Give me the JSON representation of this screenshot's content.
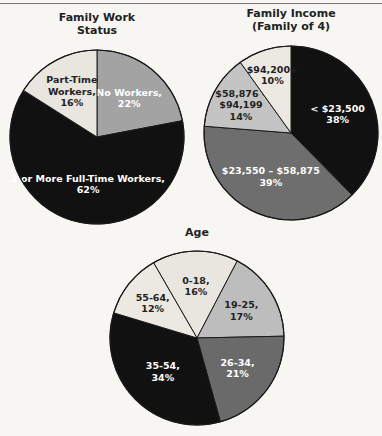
{
  "chart_data": [
    {
      "type": "pie",
      "title": [
        "Family Work",
        "Status"
      ],
      "slices": [
        {
          "label": [
            "No Workers,",
            "22%"
          ],
          "name": "No Workers",
          "value": 22,
          "color": "#a3a3a3",
          "text_color": "#ffffff"
        },
        {
          "label": [
            "1 or More Full-Time Workers,",
            "62%"
          ],
          "name": "1 or More Full-Time Workers",
          "value": 62,
          "color": "#111111",
          "text_color": "#ffffff"
        },
        {
          "label": [
            "Part-Time",
            "Workers,",
            "16%"
          ],
          "name": "Part-Time Workers",
          "value": 16,
          "color": "#e8e6df",
          "text_color": "#222222"
        }
      ],
      "start_angle_deg": 0
    },
    {
      "type": "pie",
      "title": [
        "Family Income",
        "(Family of 4)"
      ],
      "slices": [
        {
          "label": [
            "< $23,500",
            "38%"
          ],
          "name": "< $23,500",
          "value": 38,
          "color": "#111111",
          "text_color": "#ffffff"
        },
        {
          "label": [
            "$23,550 – $58,875",
            "39%"
          ],
          "name": "$23,550 – $58,875",
          "value": 39,
          "color": "#6e6e6e",
          "text_color": "#ffffff"
        },
        {
          "label": [
            "$58,876 –",
            "$94,199",
            "14%"
          ],
          "name": "$58,876 – $94,199",
          "value": 14,
          "color": "#c4c4c4",
          "text_color": "#222222"
        },
        {
          "label": [
            "$94,200+",
            "10%"
          ],
          "name": "$94,200+",
          "value": 10,
          "color": "#ebe9e2",
          "text_color": "#222222"
        }
      ],
      "start_angle_deg": 0
    },
    {
      "type": "pie",
      "title": [
        "Age"
      ],
      "slices": [
        {
          "label": [
            "0-18,",
            "16%"
          ],
          "name": "0-18",
          "value": 16,
          "color": "#e8e6df",
          "text_color": "#222222"
        },
        {
          "label": [
            "19-25,",
            "17%"
          ],
          "name": "19-25",
          "value": 17,
          "color": "#bdbdbd",
          "text_color": "#222222"
        },
        {
          "label": [
            "26-34,",
            "21%"
          ],
          "name": "26-34",
          "value": 21,
          "color": "#6a6a6a",
          "text_color": "#ffffff"
        },
        {
          "label": [
            "35-54,",
            "34%"
          ],
          "name": "35-54",
          "value": 34,
          "color": "#111111",
          "text_color": "#ffffff"
        },
        {
          "label": [
            "55-64,",
            "12%"
          ],
          "name": "55-64",
          "value": 12,
          "color": "#ebe9e2",
          "text_color": "#222222"
        }
      ],
      "start_angle_deg": -30
    }
  ]
}
